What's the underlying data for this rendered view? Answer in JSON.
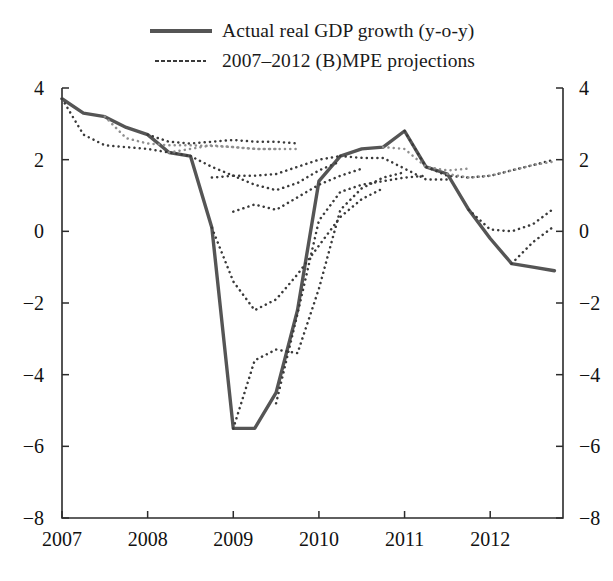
{
  "legend": {
    "items": [
      {
        "label": "Actual real GDP growth (y-o-y)",
        "style": "solid",
        "color": "#555555"
      },
      {
        "label": "2007–2012 (B)MPE projections",
        "style": "dotted",
        "color": "#3a3a3a"
      }
    ]
  },
  "chart_data": {
    "type": "line",
    "title": "",
    "xlabel": "",
    "ylabel": "",
    "xlim": [
      2007.0,
      2012.85
    ],
    "ylim": [
      -8,
      4
    ],
    "grid": false,
    "legend_position": "top-center",
    "dual_y_axis": true,
    "y_ticks": [
      4,
      2,
      0,
      -2,
      -4,
      -6,
      -8
    ],
    "y_tick_labels_left": [
      "4",
      "2",
      "0",
      "−2",
      "−4",
      "−6",
      "−8"
    ],
    "y_tick_labels_right": [
      "4",
      "2",
      "0",
      "−2",
      "−4",
      "−6",
      "−8"
    ],
    "x_ticks": [
      2007,
      2008,
      2009,
      2010,
      2011,
      2012
    ],
    "x_tick_labels": [
      "2007",
      "2008",
      "2009",
      "2010",
      "2011",
      "2012"
    ],
    "series": [
      {
        "name": "Actual real GDP growth (y-o-y)",
        "style": "solid",
        "color": "#555555",
        "width": 3.4,
        "x": [
          2007.0,
          2007.25,
          2007.5,
          2007.75,
          2008.0,
          2008.25,
          2008.5,
          2008.75,
          2009.0,
          2009.25,
          2009.5,
          2009.75,
          2010.0,
          2010.25,
          2010.5,
          2010.75,
          2011.0,
          2011.25,
          2011.5,
          2011.75,
          2012.0,
          2012.25,
          2012.5,
          2012.75
        ],
        "y": [
          3.7,
          3.3,
          3.2,
          2.9,
          2.7,
          2.2,
          2.1,
          0.1,
          -5.5,
          -5.5,
          -4.5,
          -2.2,
          1.4,
          2.1,
          2.3,
          2.35,
          2.8,
          1.8,
          1.6,
          0.6,
          -0.2,
          -0.9,
          -1.0,
          -1.1
        ]
      },
      {
        "name": "projection-2007Q1",
        "style": "dotted",
        "color": "#3a3a3a",
        "x": [
          2007.0,
          2007.25,
          2007.5,
          2007.75,
          2008.0,
          2008.25,
          2008.5
        ],
        "y": [
          3.7,
          2.7,
          2.4,
          2.35,
          2.3,
          2.2,
          2.1
        ]
      },
      {
        "name": "projection-2007Q3",
        "style": "dotted",
        "color": "#8f8f8f",
        "x": [
          2007.5,
          2007.75,
          2008.0,
          2008.25,
          2008.5,
          2008.75,
          2009.0,
          2009.25,
          2009.5
        ],
        "y": [
          3.2,
          2.6,
          2.45,
          2.4,
          2.4,
          2.38,
          2.35,
          2.3,
          2.3
        ]
      },
      {
        "name": "projection-2008Q1",
        "style": "dotted",
        "color": "#3a3a3a",
        "x": [
          2008.0,
          2008.25,
          2008.5,
          2008.75,
          2009.0,
          2009.25,
          2009.5,
          2009.75
        ],
        "y": [
          2.7,
          2.5,
          2.45,
          2.5,
          2.55,
          2.5,
          2.5,
          2.45
        ]
      },
      {
        "name": "projection-2008Q2",
        "style": "dotted",
        "color": "#8f8f8f",
        "x": [
          2008.25,
          2008.5,
          2008.75,
          2009.0,
          2009.25,
          2009.5,
          2009.75
        ],
        "y": [
          2.2,
          2.3,
          2.4,
          2.35,
          2.3,
          2.3,
          2.3
        ]
      },
      {
        "name": "projection-2008Q3",
        "style": "dotted",
        "color": "#3a3a3a",
        "x": [
          2008.5,
          2008.75,
          2009.0,
          2009.25,
          2009.5,
          2009.75,
          2010.0,
          2010.25
        ],
        "y": [
          2.1,
          1.8,
          1.55,
          1.55,
          1.6,
          1.8,
          2.0,
          2.1
        ]
      },
      {
        "name": "projection-2008Q4",
        "style": "dotted",
        "color": "#3a3a3a",
        "x": [
          2008.75,
          2009.0,
          2009.25,
          2009.5,
          2009.75,
          2010.0,
          2010.25
        ],
        "y": [
          1.5,
          1.55,
          1.3,
          1.15,
          1.35,
          1.7,
          1.95
        ]
      },
      {
        "name": "projection-2009Q1-low",
        "style": "dotted",
        "color": "#3a3a3a",
        "x": [
          2009.0,
          2009.25,
          2009.5,
          2009.75,
          2010.0,
          2010.25,
          2010.5
        ],
        "y": [
          0.55,
          0.75,
          0.6,
          0.95,
          1.3,
          1.55,
          1.75
        ]
      },
      {
        "name": "projection-2009Q2-deep",
        "style": "dotted",
        "color": "#3a3a3a",
        "x": [
          2008.75,
          2009.0,
          2009.25,
          2009.5,
          2009.75,
          2010.0,
          2010.25,
          2010.5,
          2010.75
        ],
        "y": [
          0.1,
          -1.4,
          -2.2,
          -1.9,
          -1.2,
          -0.4,
          0.4,
          0.9,
          1.2
        ]
      },
      {
        "name": "projection-2009Q2-trough",
        "style": "dotted",
        "color": "#3a3a3a",
        "x": [
          2009.0,
          2009.25,
          2009.5,
          2009.75,
          2010.0,
          2010.25,
          2010.5,
          2010.75,
          2011.0
        ],
        "y": [
          -5.5,
          -3.6,
          -3.3,
          -3.4,
          -1.6,
          0.6,
          1.2,
          1.5,
          1.65
        ]
      },
      {
        "name": "projection-2009Q4",
        "style": "dotted",
        "color": "#3a3a3a",
        "x": [
          2009.5,
          2009.75,
          2010.0,
          2010.25,
          2010.5,
          2010.75,
          2011.0,
          2011.25
        ],
        "y": [
          -4.8,
          -2.3,
          0.3,
          1.1,
          1.3,
          1.4,
          1.5,
          1.55
        ]
      },
      {
        "name": "projection-2010Q2",
        "style": "dotted",
        "color": "#3a3a3a",
        "x": [
          2010.25,
          2010.5,
          2010.75,
          2011.0,
          2011.25,
          2011.5
        ],
        "y": [
          2.1,
          2.05,
          2.05,
          1.75,
          1.45,
          1.45
        ]
      },
      {
        "name": "projection-2010Q4",
        "style": "dotted",
        "color": "#8f8f8f",
        "x": [
          2010.75,
          2011.0,
          2011.25,
          2011.5,
          2011.75
        ],
        "y": [
          2.35,
          2.3,
          1.8,
          1.7,
          1.75
        ]
      },
      {
        "name": "projection-2011Q1",
        "style": "dotted",
        "color": "#3a3a3a",
        "x": [
          2011.0,
          2011.25,
          2011.5,
          2011.75,
          2012.0,
          2012.25,
          2012.5,
          2012.75
        ],
        "y": [
          2.8,
          1.8,
          1.55,
          1.5,
          1.55,
          1.7,
          1.85,
          2.0
        ]
      },
      {
        "name": "projection-2011Q3",
        "style": "dotted",
        "color": "#8f8f8f",
        "x": [
          2011.5,
          2011.75,
          2012.0,
          2012.25,
          2012.5,
          2012.75
        ],
        "y": [
          1.6,
          1.5,
          1.55,
          1.7,
          1.85,
          1.95
        ]
      },
      {
        "name": "projection-2011Q4",
        "style": "dotted",
        "color": "#3a3a3a",
        "x": [
          2011.75,
          2012.0,
          2012.25,
          2012.5,
          2012.75
        ],
        "y": [
          0.6,
          0.05,
          0.0,
          0.2,
          0.65
        ]
      },
      {
        "name": "projection-2012Q3",
        "style": "dotted",
        "color": "#3a3a3a",
        "x": [
          2012.25,
          2012.5,
          2012.75
        ],
        "y": [
          -0.9,
          -0.3,
          0.15
        ]
      }
    ]
  }
}
